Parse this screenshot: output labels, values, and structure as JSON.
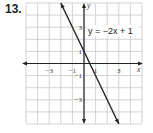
{
  "problem": {
    "number": "13."
  },
  "chart_data": {
    "type": "line",
    "title": "",
    "equation_label": "y = −2x + 1",
    "xlabel": "x",
    "ylabel": "y",
    "xlim": [
      -5,
      5
    ],
    "ylim": [
      -5,
      5
    ],
    "grid": true,
    "x_tick_labels": [
      "−3",
      "−1",
      "1",
      "3"
    ],
    "y_tick_labels": [
      "3",
      "1",
      "−1",
      "−3"
    ],
    "series": [
      {
        "name": "y = −2x + 1",
        "slope": -2,
        "intercept": 1,
        "x": [
          -2,
          3
        ],
        "y": [
          5,
          -5
        ]
      }
    ]
  },
  "colors": {
    "grid": "#c8c8c8",
    "axis": "#222222",
    "line": "#222222"
  }
}
